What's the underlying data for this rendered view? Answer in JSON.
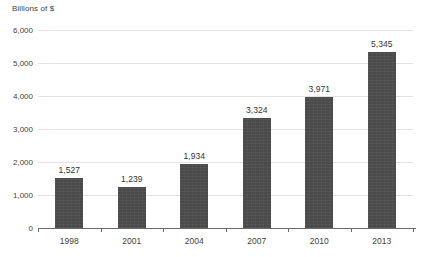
{
  "chart_data": {
    "type": "bar",
    "title": "",
    "subtitle": "",
    "xlabel": "",
    "ylabel": "Billions of $",
    "categories": [
      "1998",
      "2001",
      "2004",
      "2007",
      "2010",
      "2013"
    ],
    "values": [
      1527,
      1239,
      1934,
      3324,
      3971,
      5345
    ],
    "value_labels": [
      "1,527",
      "1,239",
      "1,934",
      "3,324",
      "3,971",
      "5,345"
    ],
    "ylim": [
      0,
      6000
    ],
    "ytick_values": [
      0,
      1000,
      2000,
      3000,
      4000,
      5000,
      6000
    ],
    "ytick_labels": [
      "0",
      "1,000",
      "2,000",
      "3,000",
      "4,000",
      "5,000",
      "6,000"
    ],
    "grid": "horizontal",
    "legend": "none",
    "bar_color": "#4a4a4a",
    "gridline_color": "#e3e3e3",
    "axis_color": "#6a6a6a",
    "background_color": "#ffffff"
  }
}
